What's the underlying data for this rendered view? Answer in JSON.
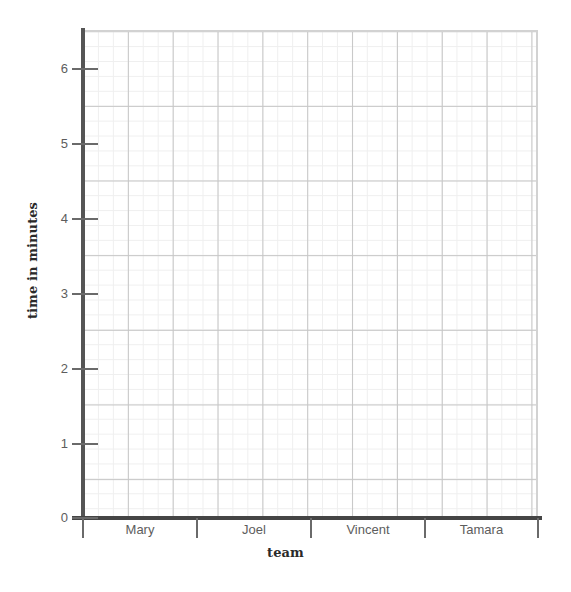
{
  "chart_data": {
    "type": "bar",
    "title": "",
    "subtitle": "",
    "xlabel": "team",
    "ylabel": "time in minutes",
    "categories": [
      "Mary",
      "Joel",
      "Vincent",
      "Tamara"
    ],
    "values": [
      null,
      null,
      null,
      null
    ],
    "series": [
      {
        "name": "time in minutes",
        "values": [
          null,
          null,
          null,
          null
        ]
      }
    ],
    "ylim": [
      0,
      6.5
    ],
    "y_ticks": [
      0,
      1,
      2,
      3,
      4,
      5,
      6
    ],
    "y_tick_labels": [
      "0",
      "1",
      "2",
      "3",
      "4",
      "5",
      "6"
    ],
    "y_major_step": 1,
    "y_minor_per_major": 5,
    "x_major_divisions_per_category": 3,
    "grid": "on",
    "grid_style": "graph-paper",
    "legend": "none",
    "annotations": [],
    "note": "Blank grid template: axes and labels drawn, no bars plotted"
  },
  "axes": {
    "y_tick_labels": [
      "6",
      "5",
      "4",
      "3",
      "2",
      "1",
      "0"
    ],
    "x_tick_labels": [
      "Mary",
      "Joel",
      "Vincent",
      "Tamara"
    ],
    "y_title": "time in minutes",
    "x_title": "team"
  },
  "colors": {
    "background": "#ffffff",
    "plot_background": "#ffffff",
    "grid_minor": "#efefef",
    "grid_major": "#c6c6c6",
    "frame": "#d2d2d2",
    "y_spine": "#555555",
    "x_spine": "#454545",
    "tick_mark": "#6a6a6a",
    "tick_label_text": "#5d5d5d",
    "axis_title_text": "#2a2a2a"
  }
}
